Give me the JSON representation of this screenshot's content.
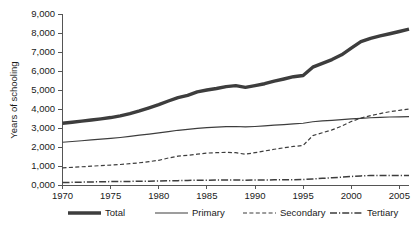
{
  "chart_data": {
    "type": "line",
    "title": "",
    "xlabel": "",
    "ylabel": "Years of schooling",
    "xlim": [
      1970,
      2006
    ],
    "ylim": [
      0,
      9000
    ],
    "grid": false,
    "legend_position": "bottom",
    "x_ticks": [
      "1970",
      "1975",
      "1980",
      "1985",
      "1990",
      "1995",
      "2000",
      "2005"
    ],
    "x_tick_values": [
      1970,
      1975,
      1980,
      1985,
      1990,
      1995,
      2000,
      2005
    ],
    "y_ticks": [
      "0,000",
      "1,000",
      "2,000",
      "3,000",
      "4,000",
      "5,000",
      "6,000",
      "7,000",
      "8,000",
      "9,000"
    ],
    "y_tick_values": [
      0,
      1000,
      2000,
      3000,
      4000,
      5000,
      6000,
      7000,
      8000,
      9000
    ],
    "x": [
      1970,
      1971,
      1972,
      1973,
      1974,
      1975,
      1976,
      1977,
      1978,
      1979,
      1980,
      1981,
      1982,
      1983,
      1984,
      1985,
      1986,
      1987,
      1988,
      1989,
      1990,
      1991,
      1992,
      1993,
      1994,
      1995,
      1996,
      1997,
      1998,
      1999,
      2000,
      2001,
      2002,
      2003,
      2004,
      2005,
      2006
    ],
    "series": [
      {
        "name": "Total",
        "style": "thick-solid",
        "color": "#3d3d3d",
        "width": 3.4,
        "values": [
          3250,
          3300,
          3360,
          3420,
          3480,
          3550,
          3640,
          3760,
          3900,
          4060,
          4230,
          4420,
          4600,
          4720,
          4900,
          5000,
          5080,
          5180,
          5230,
          5140,
          5230,
          5330,
          5470,
          5580,
          5700,
          5760,
          6200,
          6400,
          6600,
          6850,
          7200,
          7550,
          7720,
          7850,
          7960,
          8080,
          8200
        ]
      },
      {
        "name": "Primary",
        "style": "thin-solid",
        "color": "#3d3d3d",
        "width": 1.2,
        "values": [
          2250,
          2290,
          2330,
          2370,
          2410,
          2450,
          2500,
          2560,
          2620,
          2680,
          2740,
          2810,
          2880,
          2930,
          2980,
          3020,
          3050,
          3070,
          3080,
          3060,
          3080,
          3110,
          3150,
          3180,
          3220,
          3250,
          3330,
          3370,
          3400,
          3440,
          3480,
          3510,
          3540,
          3560,
          3580,
          3590,
          3600
        ]
      },
      {
        "name": "Secondary",
        "style": "dashed",
        "color": "#3d3d3d",
        "width": 1.2,
        "values": [
          900,
          930,
          960,
          990,
          1020,
          1050,
          1080,
          1120,
          1170,
          1230,
          1300,
          1420,
          1520,
          1560,
          1620,
          1680,
          1700,
          1720,
          1700,
          1620,
          1700,
          1790,
          1880,
          1960,
          2030,
          2080,
          2600,
          2750,
          2900,
          3100,
          3340,
          3520,
          3650,
          3760,
          3860,
          3930,
          4000
        ]
      },
      {
        "name": "Tertiary",
        "style": "dash-dot",
        "color": "#3d3d3d",
        "width": 1.5,
        "values": [
          130,
          140,
          150,
          160,
          170,
          180,
          185,
          190,
          195,
          200,
          210,
          220,
          230,
          240,
          250,
          255,
          258,
          260,
          260,
          255,
          260,
          265,
          270,
          275,
          280,
          285,
          320,
          350,
          380,
          410,
          450,
          480,
          500,
          500,
          495,
          495,
          500
        ]
      }
    ]
  },
  "legend": {
    "items": [
      {
        "label": "Total",
        "style": "thick-solid"
      },
      {
        "label": "Primary",
        "style": "thin-solid"
      },
      {
        "label": "Secondary",
        "style": "dashed"
      },
      {
        "label": "Tertiary",
        "style": "dash-dot"
      }
    ]
  }
}
